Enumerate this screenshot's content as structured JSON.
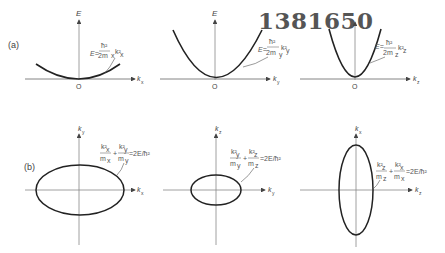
{
  "stamp": "1381650",
  "row_a": {
    "label": "(a)",
    "panels": [
      {
        "y_axis": "E",
        "x_axis": "kx",
        "origin": "O",
        "equation": "E = ħ²/(2mx) kx²"
      },
      {
        "y_axis": "E",
        "x_axis": "ky",
        "origin": "O",
        "equation": "E = ħ²/(2my) ky²"
      },
      {
        "y_axis": "E",
        "x_axis": "kz",
        "origin": "O",
        "equation": "E = ħ²/(2mz) kz²"
      }
    ]
  },
  "row_b": {
    "label": "(b)",
    "panels": [
      {
        "y_axis": "ky",
        "x_axis": "kx",
        "equation": "kx²/mx + ky²/my = 2E/ħ²"
      },
      {
        "y_axis": "kz",
        "x_axis": "ky",
        "equation": "ky²/my + kz²/mz = 2E/ħ²"
      },
      {
        "y_axis": "kx",
        "x_axis": "kz",
        "equation": "kz²/mz + kx²/mx = 2E/ħ²"
      }
    ]
  }
}
